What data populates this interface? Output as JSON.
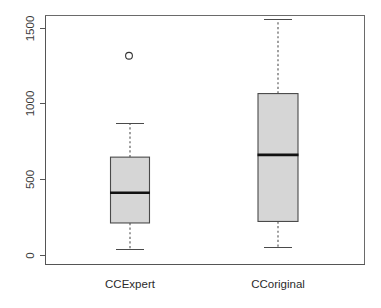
{
  "chart_data": {
    "type": "box",
    "title": "",
    "xlabel": "",
    "ylabel": "",
    "categories": [
      "CCExpert",
      "CCoriginal"
    ],
    "ylim": [
      -50,
      1620
    ],
    "yticks": [
      0,
      500,
      1000,
      1500
    ],
    "ytick_labels": [
      "0",
      "500",
      "1000",
      "1500"
    ],
    "ytick_label_rotation": 90,
    "grid": false,
    "legend": false,
    "box_fill_color": "#d6d6d6",
    "box_border_color": "#4a4a4a",
    "median_color": "#111111",
    "whisker_color": "#4a4a4a",
    "outlier_color": "#333333",
    "axis_color": "#555555",
    "background_color": "#ffffff",
    "boxes": [
      {
        "name": "CCExpert",
        "min_whisker": 40,
        "q1": 215,
        "median": 415,
        "q3": 650,
        "max_whisker": 870,
        "outliers": [
          1320
        ]
      },
      {
        "name": "CCoriginal",
        "min_whisker": 55,
        "q1": 225,
        "median": 665,
        "q3": 1070,
        "max_whisker": 1560,
        "outliers": []
      }
    ]
  },
  "axis": {
    "y_tick_0": "0",
    "y_tick_500": "500",
    "y_tick_1000": "1000",
    "y_tick_1500": "1500"
  },
  "labels": {
    "category_1": "CCExpert",
    "category_2": "CCoriginal"
  }
}
